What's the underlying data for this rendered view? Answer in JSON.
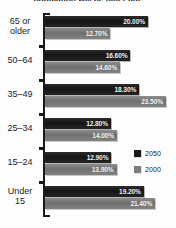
{
  "chart_data": {
    "type": "bar",
    "orientation": "horizontal",
    "title": "population will be older age",
    "categories": [
      "65 or older",
      "50–64",
      "35–49",
      "25–34",
      "15–24",
      "Under 15"
    ],
    "series": [
      {
        "name": "2050",
        "color": "#1b1b1b",
        "values": [
          20.0,
          16.6,
          18.3,
          12.8,
          12.9,
          19.2
        ]
      },
      {
        "name": "2000",
        "color": "#7d7d7d",
        "values": [
          12.7,
          14.6,
          23.5,
          14.0,
          13.9,
          21.4
        ]
      }
    ],
    "value_labels": [
      [
        "20.00%",
        "12.70%"
      ],
      [
        "16.60%",
        "14.60%"
      ],
      [
        "18.30%",
        "23.50%"
      ],
      [
        "12.80%",
        "14.00%"
      ],
      [
        "12.90%",
        "13.90%"
      ],
      [
        "19.20%",
        "21.40%"
      ]
    ],
    "xlabel": "",
    "ylabel": "",
    "xlim": [
      0,
      23.5
    ],
    "grid": false,
    "legend_position": "middle-right"
  },
  "legend": {
    "entries": [
      {
        "label": "2050"
      },
      {
        "label": "2000"
      }
    ]
  },
  "axis": {
    "category_labels": [
      {
        "line1": "65 or",
        "line2": "older"
      },
      {
        "line1": "50–64",
        "line2": ""
      },
      {
        "line1": "35–49",
        "line2": ""
      },
      {
        "line1": "25–34",
        "line2": ""
      },
      {
        "line1": "15–24",
        "line2": ""
      },
      {
        "line1": "Under",
        "line2": "15"
      }
    ]
  }
}
